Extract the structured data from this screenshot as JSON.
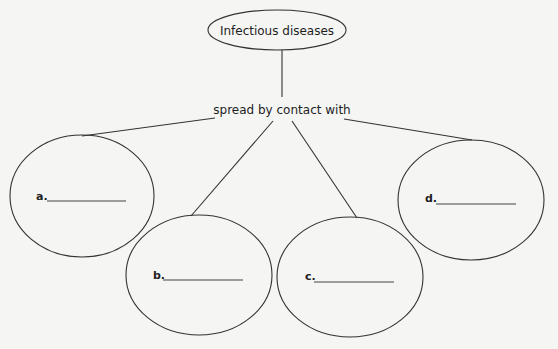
{
  "diagram": {
    "root": {
      "label": "Infectious diseases"
    },
    "connector": {
      "label": "spread by contact with"
    },
    "branches": [
      {
        "id": "a",
        "label": "a.",
        "answer": ""
      },
      {
        "id": "b",
        "label": "b.",
        "answer": ""
      },
      {
        "id": "c",
        "label": "c.",
        "answer": ""
      },
      {
        "id": "d",
        "label": "d.",
        "answer": ""
      }
    ]
  }
}
